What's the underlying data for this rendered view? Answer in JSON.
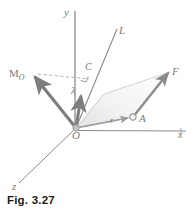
{
  "figure": {
    "caption": "Fig. 3.27",
    "labels": {
      "y_axis": "y",
      "x_axis": "x",
      "z_axis": "z",
      "origin": "O",
      "line_L": "L",
      "point_C": "C",
      "point_A": "A",
      "vector_F": "F",
      "vector_r": "r",
      "unit_vector_lambda": "λ",
      "moment_main": "M",
      "moment_sub": "O"
    },
    "colors": {
      "axis_line": "#8c8c8c",
      "vector_thick": "#7d7d7d",
      "vector_thin": "#9a9a9a",
      "dashed_line": "#a8a8a8",
      "parallelogram_stroke": "#c9c9c9",
      "parallelogram_fill": "#f2f2f2",
      "label_text": "#7a7a7a",
      "caption_text": "#1a1a1a",
      "background": "#ffffff"
    },
    "geometry": {
      "origin_px": [
        76,
        128
      ],
      "y_axis_top_px": [
        75,
        10
      ],
      "x_axis_end_px": [
        186,
        131
      ],
      "z_axis_end_px": [
        19,
        183
      ],
      "line_L_top_px": [
        116,
        30
      ],
      "point_C_px": [
        88,
        79
      ],
      "point_A_px": [
        133,
        117
      ],
      "vector_F_tip_px": [
        170,
        70
      ],
      "vector_M_tip_px": [
        32,
        74
      ],
      "vector_lambda_tip_px": [
        83,
        93
      ]
    }
  }
}
